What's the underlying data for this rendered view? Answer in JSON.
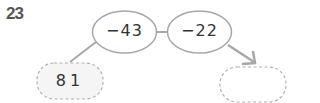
{
  "problem": {
    "number": "23",
    "start_value": "81",
    "operations": [
      "−43",
      "−22"
    ],
    "answer_box": ""
  },
  "colors": {
    "stroke": "#a8a8a8",
    "box_fill": "#f5f5f5",
    "text": "#333333",
    "number": "#555555"
  }
}
